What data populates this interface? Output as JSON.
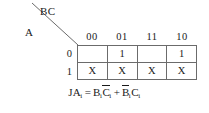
{
  "figure": {
    "type": "karnaugh-map",
    "axis_labels": {
      "columns": "BC",
      "rows": "A"
    },
    "column_headers": [
      "00",
      "01",
      "11",
      "10"
    ],
    "row_headers": [
      "0",
      "1"
    ],
    "cells": [
      [
        "",
        "1",
        "",
        "1"
      ],
      [
        "X",
        "X",
        "X",
        "X"
      ]
    ],
    "equation": {
      "lhs_var": "JA",
      "lhs_sub": "i",
      "equals": "=",
      "plus": "+",
      "term1": {
        "v1": "B",
        "v1_sub": "i",
        "v1_bar": false,
        "v2": "C",
        "v2_sub": "i",
        "v2_bar": true
      },
      "term2": {
        "v1": "B",
        "v1_sub": "i",
        "v1_bar": true,
        "v2": "C",
        "v2_sub": "i",
        "v2_bar": false
      },
      "plain_text": "JAi = BiCi' + Bi'Ci"
    },
    "colors": {
      "grid_line": "#6b6b6b",
      "text": "#1a1a1a",
      "background": "#ffffff"
    }
  }
}
